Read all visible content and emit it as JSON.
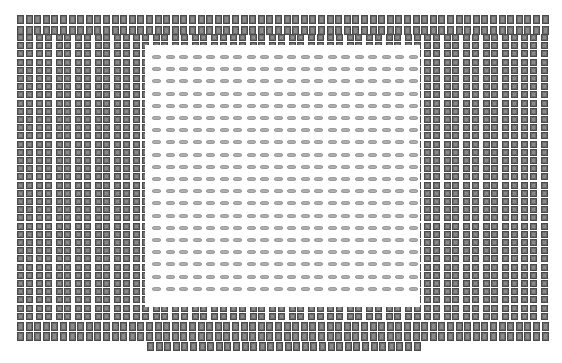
{
  "diagram": {
    "type": "pad-array-layout",
    "colors": {
      "pad_fill": "#6e6e6e",
      "pad_inner": "#8a8a8a",
      "glyph": "#b0b0b0",
      "background": "#ffffff"
    },
    "outer_rows_top": {
      "x_start": 17,
      "x_end": 545,
      "y": [
        15,
        26
      ],
      "pitch_x": 8.6,
      "cell_w": 7,
      "cell_h": 9
    },
    "outer_rows_bottom": {
      "x_start": 17,
      "x_end": 545,
      "y": [
        322,
        332
      ],
      "pitch_x": 8.6,
      "cell_w": 7,
      "cell_h": 9
    },
    "bottom_extra_row": {
      "x_start": 147,
      "x_end": 420,
      "y": 342,
      "pitch_x": 8.6,
      "cell_w": 7,
      "cell_h": 9
    },
    "pad_field": {
      "x_start": 17,
      "x_end": 545,
      "y_start": 34,
      "y_end": 318,
      "pitch_x": 8.6,
      "pitch_y": 8.2,
      "cell_w": 7,
      "cell_h": 7,
      "group_gap_every": 2
    },
    "core_region": {
      "x": 145,
      "y": 45,
      "w": 275,
      "h": 262
    },
    "core_glyphs": {
      "x_start": 152,
      "y_start": 55,
      "pitch_x": 13.5,
      "pitch_y": 12.2,
      "cols": 20,
      "rows": 20
    }
  }
}
